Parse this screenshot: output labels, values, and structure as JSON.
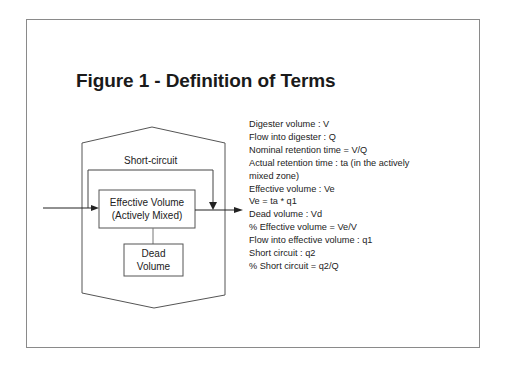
{
  "title": "Figure 1 - Definition of Terms",
  "diagram": {
    "short_circuit_label": "Short-circuit",
    "effective_volume_line1": "Effective Volume",
    "effective_volume_line2": "(Actively Mixed)",
    "dead_volume_line1": "Dead",
    "dead_volume_line2": "Volume",
    "colors": {
      "line": "#555555",
      "frame": "#8a8a8a",
      "text": "#222222"
    }
  },
  "terms": [
    "Digester volume : V",
    "Flow into digester : Q",
    "Nominal retention time = V/Q",
    "Actual retention time : ta (in the actively mixed zone)",
    "Effective volume : Ve",
    "Ve = ta * q1",
    "Dead volume : Vd",
    "% Effective volume = Ve/V",
    "Flow into effective volume : q1",
    "Short circuit : q2",
    "% Short circuit = q2/Q"
  ]
}
